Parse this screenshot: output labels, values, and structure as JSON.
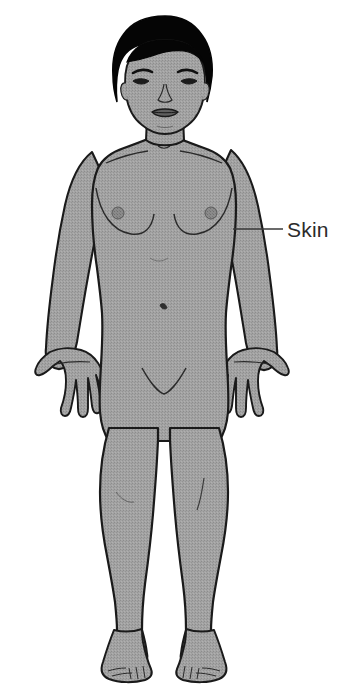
{
  "diagram": {
    "background_color": "#ffffff",
    "skin_fill_color": "#9e9e9e",
    "outline_color": "#1a1a1a",
    "hair_color": "#050505",
    "nipple_color": "#6f6f6f",
    "leader_line_color": "#3a3a3a",
    "label_text_color": "#2b2b2b"
  },
  "labels": [
    {
      "id": "skin",
      "text": "Skin",
      "leader_line": {
        "from_x": 233,
        "from_y": 229,
        "to_x": 283,
        "to_y": 229
      },
      "target_part": "left-upper-arm"
    }
  ],
  "body_parts": {
    "head": "head",
    "hair": "hair",
    "face": "face",
    "eyes": "eyes",
    "eyebrows": "eyebrows",
    "nose": "nose",
    "mouth": "mouth",
    "ears": "ears",
    "neck": "neck",
    "clavicles": "clavicles",
    "torso": "torso",
    "breasts": "breasts",
    "nipples": "nipples",
    "navel": "navel",
    "pubic_area": "pubic-area",
    "left_arm": "left-arm",
    "right_arm": "right-arm",
    "left_hand": "left-hand",
    "right_hand": "right-hand",
    "left_leg": "left-leg",
    "right_leg": "right-leg",
    "left_knee": "left-knee",
    "right_knee": "right-knee",
    "left_foot": "left-foot",
    "right_foot": "right-foot"
  }
}
